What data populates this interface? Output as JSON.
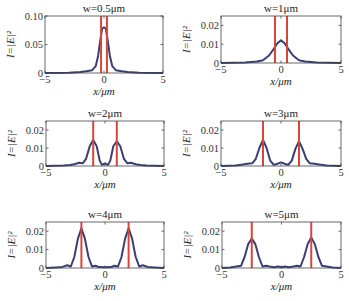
{
  "figure": {
    "colors": {
      "curve": "#3a3f73",
      "marker": "#d9453a",
      "axis": "#444444"
    },
    "xlabel": "x/μm",
    "ylabel": "I=|E|²"
  },
  "chart_data": [
    {
      "type": "line",
      "title": "w=0.5μm",
      "xlabel": "x/μm",
      "ylabel": "I=|E|²",
      "xlim": [
        -5,
        5
      ],
      "ylim": [
        0,
        0.1
      ],
      "xticks": [
        -5,
        0,
        5
      ],
      "yticks": [
        0,
        0.05,
        0.1
      ],
      "ytick_labels": [
        "0",
        "0.05",
        "0.10"
      ],
      "series": [
        {
          "name": "intensity",
          "x": [
            -5,
            -3,
            -2,
            -1.5,
            -1,
            -0.7,
            -0.5,
            -0.3,
            -0.15,
            0,
            0.15,
            0.3,
            0.5,
            0.7,
            1,
            1.5,
            2,
            3,
            5
          ],
          "y": [
            0,
            0.0005,
            0.002,
            0.003,
            0.005,
            0.012,
            0.03,
            0.06,
            0.078,
            0.08,
            0.078,
            0.06,
            0.03,
            0.012,
            0.005,
            0.003,
            0.002,
            0.0005,
            0
          ]
        }
      ],
      "markers_x": [
        -0.25,
        0.25
      ]
    },
    {
      "type": "line",
      "title": "w=1μm",
      "xlabel": "x/μm",
      "ylabel": "I=|E|²",
      "xlim": [
        -5,
        5
      ],
      "ylim": [
        0,
        0.025
      ],
      "xticks": [
        -5,
        0,
        5
      ],
      "yticks": [
        0,
        0.01,
        0.02
      ],
      "ytick_labels": [
        "0",
        "0.01",
        "0.02"
      ],
      "series": [
        {
          "name": "intensity",
          "x": [
            -5,
            -3,
            -2,
            -1.5,
            -1,
            -0.6,
            -0.3,
            0,
            0.3,
            0.6,
            1,
            1.5,
            2,
            3,
            5
          ],
          "y": [
            0,
            0.0002,
            0.0008,
            0.0015,
            0.004,
            0.0075,
            0.0105,
            0.012,
            0.0105,
            0.0075,
            0.004,
            0.0015,
            0.0008,
            0.0002,
            0
          ]
        }
      ],
      "markers_x": [
        -0.5,
        0.5
      ]
    },
    {
      "type": "line",
      "title": "w=2μm",
      "xlabel": "x/μm",
      "ylabel": "I=|E|²",
      "xlim": [
        -5,
        5
      ],
      "ylim": [
        0,
        0.025
      ],
      "xticks": [
        -5,
        0,
        5
      ],
      "yticks": [
        0,
        0.01,
        0.02
      ],
      "ytick_labels": [
        "0",
        "0.01",
        "0.02"
      ],
      "series": [
        {
          "name": "intensity",
          "x": [
            -5,
            -3.5,
            -3,
            -2.6,
            -2.2,
            -1.9,
            -1.6,
            -1.3,
            -1,
            -0.7,
            -0.45,
            -0.25,
            0,
            0.25,
            0.45,
            0.7,
            1,
            1.3,
            1.6,
            1.9,
            2.2,
            2.6,
            3,
            3.5,
            5
          ],
          "y": [
            0,
            0.0002,
            0.0006,
            0.001,
            0.0018,
            0.0015,
            0.004,
            0.011,
            0.0145,
            0.011,
            0.003,
            0.0006,
            0.0015,
            0.0006,
            0.003,
            0.011,
            0.0138,
            0.011,
            0.004,
            0.0015,
            0.0018,
            0.001,
            0.0006,
            0.0002,
            0
          ]
        }
      ],
      "markers_x": [
        -1,
        1
      ]
    },
    {
      "type": "line",
      "title": "w=3μm",
      "xlabel": "x/μm",
      "ylabel": "I=|E|²",
      "xlim": [
        -5,
        5
      ],
      "ylim": [
        0,
        0.025
      ],
      "xticks": [
        -5,
        0,
        5
      ],
      "yticks": [
        0,
        0.01,
        0.02
      ],
      "ytick_labels": [
        "0",
        "0.01",
        "0.02"
      ],
      "series": [
        {
          "name": "intensity",
          "x": [
            -5,
            -3.8,
            -3.2,
            -2.8,
            -2.4,
            -2.1,
            -1.8,
            -1.5,
            -1.2,
            -0.9,
            -0.6,
            -0.3,
            0,
            0.3,
            0.6,
            0.9,
            1.2,
            1.5,
            1.8,
            2.1,
            2.4,
            2.8,
            3.2,
            3.8,
            5
          ],
          "y": [
            0,
            0.0002,
            0.0008,
            0.0012,
            0.0015,
            0.004,
            0.01,
            0.0145,
            0.01,
            0.003,
            0.0006,
            0.0012,
            0.002,
            0.0012,
            0.0006,
            0.003,
            0.0095,
            0.0138,
            0.0095,
            0.004,
            0.0015,
            0.0012,
            0.0008,
            0.0002,
            0
          ]
        }
      ],
      "markers_x": [
        -1.5,
        1.5
      ]
    },
    {
      "type": "line",
      "title": "w=4μm",
      "xlabel": "x/μm",
      "ylabel": "I=|E|²",
      "xlim": [
        -5,
        5
      ],
      "ylim": [
        0,
        0.025
      ],
      "xticks": [
        -5,
        0,
        5
      ],
      "yticks": [
        0,
        0.01,
        0.02
      ],
      "ytick_labels": [
        "0",
        "0.01",
        "0.02"
      ],
      "series": [
        {
          "name": "intensity",
          "x": [
            -5,
            -4.2,
            -3.6,
            -3.2,
            -2.9,
            -2.6,
            -2.3,
            -2,
            -1.7,
            -1.4,
            -1.1,
            -0.8,
            -0.5,
            0,
            0.5,
            0.8,
            1.1,
            1.4,
            1.7,
            2,
            2.3,
            2.6,
            2.9,
            3.2,
            3.6,
            4.2,
            5
          ],
          "y": [
            0,
            0.0003,
            0.0006,
            0.0015,
            0.0008,
            0.006,
            0.016,
            0.0215,
            0.016,
            0.006,
            0.0008,
            0.0012,
            0.0005,
            0.0004,
            0.0005,
            0.0012,
            0.0008,
            0.006,
            0.016,
            0.0215,
            0.016,
            0.006,
            0.0008,
            0.0015,
            0.0006,
            0.0003,
            0
          ]
        }
      ],
      "markers_x": [
        -2,
        2
      ]
    },
    {
      "type": "line",
      "title": "w=5μm",
      "xlabel": "x/μm",
      "ylabel": "I=|E|²",
      "xlim": [
        -5,
        5
      ],
      "ylim": [
        0,
        0.025
      ],
      "xticks": [
        -5,
        0,
        5
      ],
      "yticks": [
        0,
        0.01,
        0.02
      ],
      "ytick_labels": [
        "0",
        "0.01",
        "0.02"
      ],
      "series": [
        {
          "name": "intensity",
          "x": [
            -5,
            -4.3,
            -3.8,
            -3.4,
            -3.1,
            -2.8,
            -2.5,
            -2.2,
            -1.9,
            -1.6,
            -1.3,
            -1,
            -0.6,
            -0.3,
            0,
            0.3,
            0.6,
            1,
            1.3,
            1.6,
            1.9,
            2.2,
            2.5,
            2.8,
            3.1,
            3.4,
            3.8,
            4.3,
            5
          ],
          "y": [
            0,
            0.0003,
            0.0008,
            0.0012,
            0.006,
            0.013,
            0.016,
            0.013,
            0.006,
            0.0008,
            0.0012,
            0.0008,
            0.0004,
            0.0008,
            0.0004,
            0.0008,
            0.0004,
            0.0008,
            0.0012,
            0.0008,
            0.006,
            0.013,
            0.0165,
            0.013,
            0.006,
            0.0012,
            0.0008,
            0.0003,
            0
          ]
        }
      ],
      "markers_x": [
        -2.5,
        2.5
      ]
    }
  ]
}
